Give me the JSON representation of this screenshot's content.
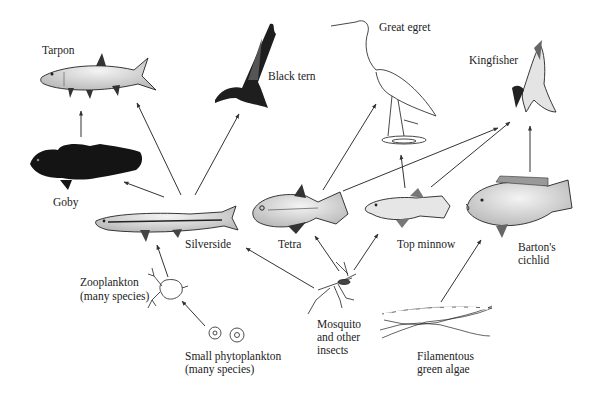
{
  "diagram": {
    "type": "food-web",
    "organisms": [
      {
        "id": "tarpon",
        "label": "Tarpon",
        "trophic": "top predator"
      },
      {
        "id": "black_tern",
        "label": "Black tern",
        "trophic": "top predator"
      },
      {
        "id": "great_egret",
        "label": "Great egret",
        "trophic": "top predator"
      },
      {
        "id": "kingfisher",
        "label": "Kingfisher",
        "trophic": "top predator"
      },
      {
        "id": "goby",
        "label": "Goby",
        "trophic": "secondary consumer"
      },
      {
        "id": "silverside",
        "label": "Silverside",
        "trophic": "consumer"
      },
      {
        "id": "tetra",
        "label": "Tetra",
        "trophic": "consumer"
      },
      {
        "id": "top_minnow",
        "label": "Top minnow",
        "trophic": "consumer"
      },
      {
        "id": "bartons_cichlid",
        "label_line1": "Barton's",
        "label_line2": "cichlid",
        "trophic": "consumer"
      },
      {
        "id": "zooplankton",
        "label_line1": "Zooplankton",
        "label_line2": "(many species)",
        "trophic": "primary consumer"
      },
      {
        "id": "mosquito",
        "label_line1": "Mosquito",
        "label_line2": "and other",
        "label_line3": "insects",
        "trophic": "primary consumer"
      },
      {
        "id": "phytoplankton",
        "label_line1": "Small phytoplankton",
        "label_line2": "(many species)",
        "trophic": "producer"
      },
      {
        "id": "algae",
        "label_line1": "Filamentous",
        "label_line2": "green algae",
        "trophic": "producer"
      }
    ],
    "edges": [
      {
        "from": "goby",
        "to": "tarpon"
      },
      {
        "from": "silverside",
        "to": "tarpon"
      },
      {
        "from": "silverside",
        "to": "goby"
      },
      {
        "from": "silverside",
        "to": "black_tern"
      },
      {
        "from": "tetra",
        "to": "great_egret"
      },
      {
        "from": "tetra",
        "to": "kingfisher"
      },
      {
        "from": "top_minnow",
        "to": "great_egret"
      },
      {
        "from": "top_minnow",
        "to": "kingfisher"
      },
      {
        "from": "bartons_cichlid",
        "to": "kingfisher"
      },
      {
        "from": "zooplankton",
        "to": "silverside"
      },
      {
        "from": "phytoplankton",
        "to": "zooplankton"
      },
      {
        "from": "mosquito",
        "to": "silverside"
      },
      {
        "from": "mosquito",
        "to": "tetra"
      },
      {
        "from": "mosquito",
        "to": "top_minnow"
      },
      {
        "from": "algae",
        "to": "bartons_cichlid"
      }
    ]
  },
  "labels": {
    "tarpon": "Tarpon",
    "black_tern": "Black tern",
    "great_egret": "Great egret",
    "kingfisher": "Kingfisher",
    "goby": "Goby",
    "silverside": "Silverside",
    "tetra": "Tetra",
    "top_minnow": "Top minnow",
    "bartons_cichlid_1": "Barton's",
    "bartons_cichlid_2": "cichlid",
    "zooplankton_1": "Zooplankton",
    "zooplankton_2": "(many species)",
    "mosquito_1": "Mosquito",
    "mosquito_2": "and other",
    "mosquito_3": "insects",
    "phytoplankton_1": "Small phytoplankton",
    "phytoplankton_2": "(many species)",
    "algae_1": "Filamentous",
    "algae_2": "green algae"
  },
  "colors": {
    "background": "#ffffff",
    "ink": "#222222",
    "arrow": "#333333"
  }
}
